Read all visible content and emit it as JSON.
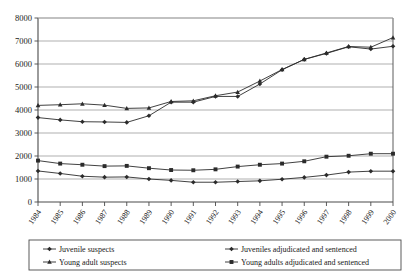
{
  "chart_data": {
    "type": "line",
    "title": "",
    "xlabel": "",
    "ylabel": "",
    "ylim": [
      0,
      8000
    ],
    "ytick_step": 1000,
    "yticks": [
      "0",
      "1000",
      "2000",
      "3000",
      "4000",
      "5000",
      "6000",
      "7000",
      "8000"
    ],
    "grid": true,
    "legend_position": "bottom",
    "categories": [
      "1984",
      "1985",
      "1986",
      "1987",
      "1988",
      "1989",
      "1990",
      "1991",
      "1992",
      "1993",
      "1994",
      "1995",
      "1996",
      "1997",
      "1998",
      "1999",
      "2000"
    ],
    "series": [
      {
        "name": "Juvenile suspects",
        "marker": "diamond",
        "values": [
          3670,
          3570,
          3490,
          3480,
          3460,
          3750,
          4340,
          4340,
          4590,
          4590,
          5130,
          5750,
          6200,
          6460,
          6750,
          6650,
          6770
        ]
      },
      {
        "name": "Young adult suspects",
        "marker": "triangle",
        "values": [
          4200,
          4230,
          4270,
          4210,
          4070,
          4090,
          4370,
          4400,
          4620,
          4780,
          5260,
          5760,
          6200,
          6480,
          6760,
          6730,
          7150
        ]
      },
      {
        "name": "Juveniles adjudicated and sentenced",
        "marker": "diamond",
        "values": [
          1350,
          1240,
          1120,
          1080,
          1090,
          1000,
          940,
          860,
          860,
          890,
          920,
          990,
          1070,
          1170,
          1300,
          1340,
          1340
        ]
      },
      {
        "name": "Young adults adjudicated and sentenced",
        "marker": "square",
        "values": [
          1800,
          1670,
          1620,
          1560,
          1570,
          1470,
          1390,
          1380,
          1420,
          1540,
          1620,
          1670,
          1770,
          1970,
          2010,
          2100,
          2100
        ]
      }
    ]
  },
  "legend": {
    "items": [
      {
        "label": "Juvenile suspects",
        "marker": "diamond"
      },
      {
        "label": "Juveniles adjudicated and sentenced",
        "marker": "diamond"
      },
      {
        "label": "Young adult suspects",
        "marker": "triangle"
      },
      {
        "label": "Young adults adjudicated and sentenced",
        "marker": "square"
      }
    ]
  },
  "colors": {
    "line": "#2b2b2b",
    "grid": "#a6a6a6",
    "axis": "#4a4a4a",
    "text": "#1a1a1a",
    "background": "#ffffff"
  }
}
